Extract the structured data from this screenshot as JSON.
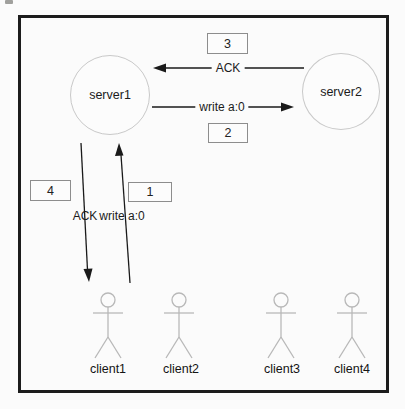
{
  "diagram": {
    "servers": [
      {
        "label": "server1"
      },
      {
        "label": "server2"
      }
    ],
    "clients": [
      {
        "label": "client1"
      },
      {
        "label": "client2"
      },
      {
        "label": "client3"
      },
      {
        "label": "client4"
      }
    ],
    "messages": [
      {
        "step": "1",
        "label": "write a:0",
        "from": "client2",
        "to": "server1"
      },
      {
        "step": "2",
        "label": "write a:0",
        "from": "server1",
        "to": "server2"
      },
      {
        "step": "3",
        "label": "ACK",
        "from": "server2",
        "to": "server1"
      },
      {
        "step": "4",
        "label": "ACK",
        "from": "server1",
        "to": "client1"
      }
    ],
    "colors": {
      "arrow": "#1a1a1a",
      "server_stroke": "#c9c9c9",
      "figure_stroke": "#b8b8b8",
      "box_border": "#8d8d8d",
      "frame_border": "#1c1c1c",
      "background": "#fbfbfb"
    }
  }
}
